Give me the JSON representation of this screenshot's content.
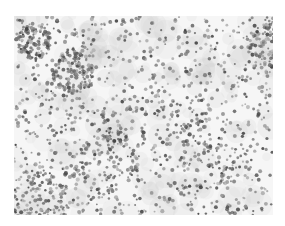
{
  "image": {
    "description": "Grayscale micrograph of densely scattered small dark particles/cells on a light background",
    "background_color": "#ffffff",
    "field_color": "#f6f6f6",
    "particle_color_dark": "#3c3c3c",
    "particle_color_light": "#9a9a9a",
    "frame": {
      "x": 14,
      "y": 16,
      "width": 259,
      "height": 199
    },
    "particle_count": 1700,
    "seed": 7,
    "clusters": [
      {
        "x": 60,
        "y": 55,
        "r": 22,
        "weight": 1.6
      },
      {
        "x": 25,
        "y": 185,
        "r": 30,
        "weight": 2.2
      },
      {
        "x": 255,
        "y": 30,
        "r": 22,
        "weight": 1.4
      },
      {
        "x": 20,
        "y": 25,
        "r": 18,
        "weight": 1.2
      },
      {
        "x": 200,
        "y": 135,
        "r": 40,
        "weight": 1.1
      },
      {
        "x": 140,
        "y": 120,
        "r": 50,
        "weight": 1.0
      },
      {
        "x": 90,
        "y": 145,
        "r": 35,
        "weight": 1.1
      }
    ]
  }
}
